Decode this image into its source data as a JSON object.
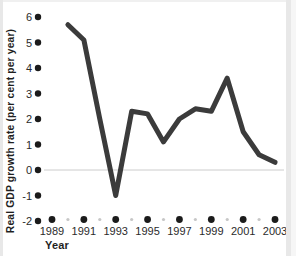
{
  "page": {
    "background": "#ffffff",
    "edge_color": "#e8e8e8"
  },
  "chart": {
    "y_axis_title": "Real GDP growth rate (per cent per year)",
    "x_axis_title": "Year",
    "colors": {
      "line": "#3b3b3b",
      "major_tick_dot": "#1b1b1b",
      "minor_tick_dot": "#c7c7c7",
      "zero_line": "#cccccc",
      "label_text": "#2b2b2b"
    }
  },
  "chart_data": {
    "type": "line",
    "title": "",
    "xlabel": "Year",
    "ylabel": "Real GDP growth rate (per cent per year)",
    "x": [
      1990,
      1991,
      1992,
      1993,
      1994,
      1995,
      1996,
      1997,
      1998,
      1999,
      2000,
      2001,
      2002,
      2003
    ],
    "values": [
      5.7,
      5.1,
      2.0,
      -1.0,
      2.3,
      2.2,
      1.1,
      2.0,
      2.4,
      2.3,
      3.6,
      1.5,
      0.6,
      0.3
    ],
    "xlim": [
      1989,
      2003
    ],
    "ylim": [
      -2,
      6
    ],
    "y_tick_values": [
      6,
      5,
      4,
      3,
      2,
      1,
      0,
      -1,
      -2
    ],
    "y_tick_labels": [
      "6",
      "5",
      "4",
      "3",
      "2",
      "1",
      "0",
      "-1",
      "-2"
    ],
    "x_major_tick_years": [
      1989,
      1991,
      1993,
      1995,
      1997,
      1999,
      2001,
      2003
    ],
    "x_major_tick_labels": [
      "1989",
      "1991",
      "1993",
      "1995",
      "1997",
      "1999",
      "2001",
      "2003"
    ],
    "x_minor_tick_years": [
      1990,
      1992,
      1994,
      1996,
      1998,
      2000,
      2002
    ],
    "grid": "zero-line-only",
    "legend": "none"
  }
}
